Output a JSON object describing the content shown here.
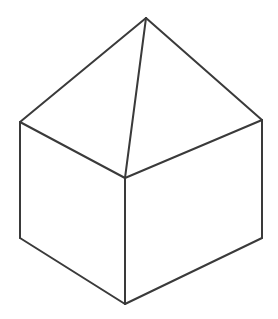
{
  "diagram": {
    "stroke_color": "#3a3a3a",
    "background_color": "#ffffff",
    "vertices": {
      "apex": [
        146,
        18
      ],
      "left_top": [
        20,
        122
      ],
      "right_top": [
        262,
        120
      ],
      "front_top": [
        125,
        178
      ],
      "left_bottom": [
        20,
        238
      ],
      "right_bottom": [
        262,
        238
      ],
      "front_bottom": [
        125,
        304
      ]
    },
    "edges": [
      {
        "name": "apex-to-left-top",
        "from": "apex",
        "to": "left_top"
      },
      {
        "name": "apex-to-right-top",
        "from": "apex",
        "to": "right_top"
      },
      {
        "name": "apex-to-front-top",
        "from": "apex",
        "to": "front_top"
      },
      {
        "name": "left-top-to-front-top",
        "from": "left_top",
        "to": "front_top"
      },
      {
        "name": "right-top-to-front-top",
        "from": "right_top",
        "to": "front_top"
      },
      {
        "name": "left-vertical",
        "from": "left_top",
        "to": "left_bottom"
      },
      {
        "name": "right-vertical",
        "from": "right_top",
        "to": "right_bottom"
      },
      {
        "name": "front-vertical",
        "from": "front_top",
        "to": "front_bottom"
      },
      {
        "name": "left-bottom-to-front-bottom",
        "from": "left_bottom",
        "to": "front_bottom"
      },
      {
        "name": "right-bottom-to-front-bottom",
        "from": "right_bottom",
        "to": "front_bottom"
      }
    ]
  }
}
